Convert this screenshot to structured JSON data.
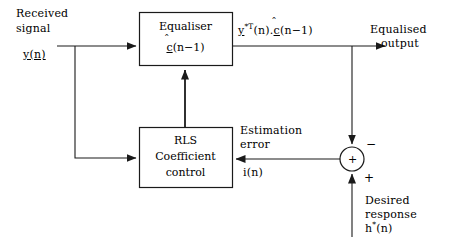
{
  "diagram": {
    "stroke_color": "#1a1a1a",
    "background_color": "#ffffff",
    "blocks": [
      {
        "id": "equaliser",
        "line1": "Equaliser",
        "line2_pre": "c",
        "line2_post": "(n−1)",
        "hat": "̂"
      },
      {
        "id": "rls",
        "line1": "RLS",
        "line2": "Coefficient",
        "line3": "control"
      }
    ],
    "labels": {
      "received_signal_line1": "Received",
      "received_signal_line2": "signal",
      "received_signal_var": "y(n)",
      "equaliser_output_expr_y": "y",
      "equaliser_output_expr_sup": "*T",
      "equaliser_output_expr_mid": "(n).",
      "equaliser_output_expr_c": "c",
      "equaliser_output_expr_end": "(n−1)",
      "equalised_output_line1": "Equalised",
      "equalised_output_line2": "output",
      "estimation_error_line1": "Estimation",
      "estimation_error_line2": "error",
      "estimation_error_var": "i(n)",
      "desired_response_line1": "Desired",
      "desired_response_line2": "response",
      "desired_response_var_h": "h",
      "desired_response_var_sup": "*",
      "desired_response_var_end": "(n)"
    },
    "junction": {
      "inner_sign": "+",
      "top_sign": "−",
      "bottom_sign": "+"
    }
  }
}
